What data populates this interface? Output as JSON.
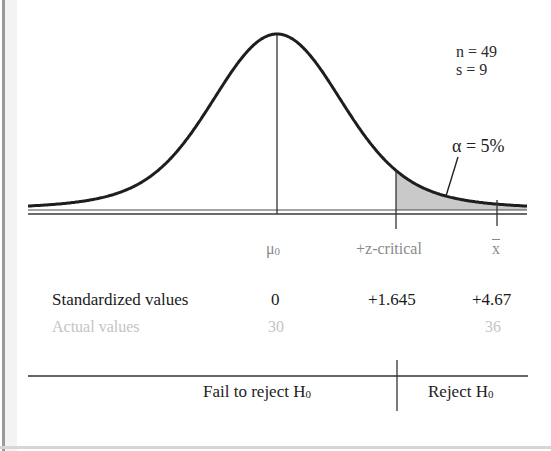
{
  "chart_data": {
    "type": "diagram",
    "distribution": "normal",
    "stats": {
      "n": "n = 49",
      "s": "s = 9"
    },
    "alpha_label": "α = 5%",
    "alpha": 0.05,
    "axis_markers": [
      {
        "label": "μ",
        "sub": "0",
        "standardized": "0",
        "actual": "30"
      },
      {
        "label": "+z-critical",
        "standardized": "+1.645",
        "actual": ""
      },
      {
        "label": "x",
        "overline": true,
        "standardized": "+4.67",
        "actual": "36"
      }
    ],
    "row_labels": {
      "standardized": "Standardized values",
      "actual": "Actual values"
    },
    "regions": [
      {
        "label": "Fail to reject H",
        "sub": "0"
      },
      {
        "label": "Reject H",
        "sub": "0"
      }
    ],
    "shaded_region": "right tail beyond +z-critical"
  },
  "colors": {
    "curve": "#1e1e1e",
    "shade": "#c8c8c8",
    "axis": "#3a3a3a",
    "faint_text": "#c4c4c4",
    "muted_text": "#8a8a8a"
  }
}
